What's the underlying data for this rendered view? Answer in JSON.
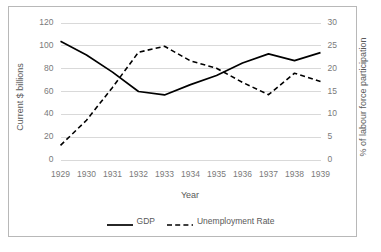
{
  "chart_data": {
    "type": "line",
    "title": "",
    "xlabel": "Year",
    "ylabel": "Current $ billions",
    "ylabel_secondary": "% of labour force participation",
    "categories": [
      "1929",
      "1930",
      "1931",
      "1932",
      "1933",
      "1934",
      "1935",
      "1936",
      "1937",
      "1938",
      "1939"
    ],
    "x": [
      1929,
      1930,
      1931,
      1932,
      1933,
      1934,
      1935,
      1936,
      1937,
      1938,
      1939
    ],
    "ylim": [
      0,
      120
    ],
    "ylim_secondary": [
      0,
      30
    ],
    "yticks": [
      0,
      20,
      40,
      60,
      80,
      100,
      120
    ],
    "yticks_secondary": [
      0,
      5,
      10,
      15,
      20,
      25,
      30
    ],
    "grid": true,
    "legend_position": "bottom",
    "series": [
      {
        "name": "GDP",
        "axis": "left",
        "style": "solid",
        "color": "#000000",
        "values": [
          104,
          92,
          77,
          60,
          57,
          66,
          74,
          85,
          93,
          87,
          94
        ]
      },
      {
        "name": "Unemployment Rate",
        "axis": "right",
        "style": "dashed",
        "color": "#000000",
        "values": [
          3.2,
          8.7,
          15.9,
          23.6,
          24.9,
          21.7,
          20.1,
          17.0,
          14.3,
          19.0,
          17.2
        ]
      }
    ]
  },
  "axes": {
    "left_title": "Current $ billions",
    "right_title": "% of labour force participation",
    "x_title": "Year"
  },
  "legend": {
    "entries": [
      {
        "label": "GDP",
        "style": "solid"
      },
      {
        "label": "Unemployment Rate",
        "style": "dashed"
      }
    ]
  }
}
